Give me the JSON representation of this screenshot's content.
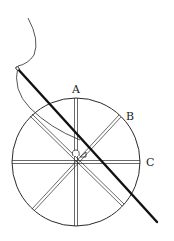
{
  "diagram": {
    "labels": {
      "a": "A",
      "b": "B",
      "c": "C"
    },
    "colors": {
      "line": "#2a2a2a",
      "needle": "#111111",
      "background": "#ffffff"
    },
    "circle": {
      "cx": 76,
      "cy": 162,
      "r": 64
    },
    "spokes": 8
  }
}
